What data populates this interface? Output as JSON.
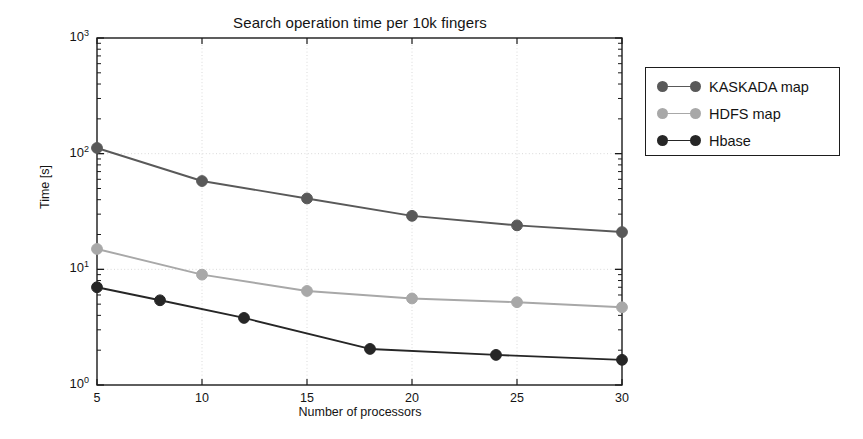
{
  "chart_data": {
    "type": "line",
    "title": "Search operation time per 10k fingers",
    "xlabel": "Number of processors",
    "ylabel": "Time [s]",
    "xscale": "linear",
    "yscale": "log",
    "xlim": [
      5,
      30
    ],
    "ylim": [
      1,
      1000
    ],
    "xticks": [
      "5",
      "10",
      "15",
      "20",
      "25",
      "30"
    ],
    "xtick_values": [
      5,
      10,
      15,
      20,
      25,
      30
    ],
    "yticks": [
      "10^0",
      "10^1",
      "10^2",
      "10^3"
    ],
    "ytick_values": [
      1,
      10,
      100,
      1000
    ],
    "ytick_labels": [
      {
        "base": "10",
        "exp": "0"
      },
      {
        "base": "10",
        "exp": "1"
      },
      {
        "base": "10",
        "exp": "2"
      },
      {
        "base": "10",
        "exp": "3"
      }
    ],
    "grid": true,
    "grid_style": "dotted",
    "legend_position": "outside-right-top",
    "series": [
      {
        "name": "KASKADA map",
        "color": "#595959",
        "marker": "circle",
        "x": [
          5,
          10,
          15,
          20,
          25,
          30
        ],
        "values": [
          112,
          58,
          41,
          29,
          24,
          21
        ]
      },
      {
        "name": "HDFS map",
        "color": "#a8a8a8",
        "marker": "circle",
        "x": [
          5,
          10,
          15,
          20,
          25,
          30
        ],
        "values": [
          15,
          9.0,
          6.5,
          5.6,
          5.2,
          4.7
        ]
      },
      {
        "name": "Hbase",
        "color": "#262626",
        "marker": "circle",
        "x": [
          5,
          8,
          12,
          18,
          24,
          30
        ],
        "values": [
          7.0,
          5.4,
          3.8,
          2.05,
          1.82,
          1.65
        ]
      }
    ]
  },
  "legend": {
    "entries": [
      {
        "label": "KASKADA map",
        "color": "#595959"
      },
      {
        "label": "HDFS map",
        "color": "#a8a8a8"
      },
      {
        "label": "Hbase",
        "color": "#262626"
      }
    ]
  },
  "colors": {
    "axis": "#1a1a1a",
    "grid": "#d9d9d9",
    "background": "#ffffff",
    "text": "#141414"
  }
}
